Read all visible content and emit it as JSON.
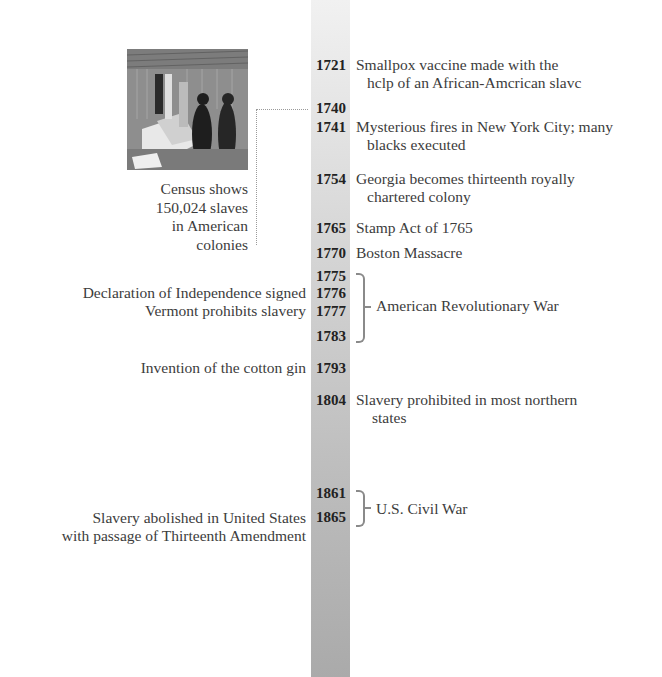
{
  "timeline": {
    "bar_colors": {
      "top": "#f1f1f1",
      "bottom": "#aaaaaa"
    },
    "years": [
      {
        "year": "1721",
        "y": 57
      },
      {
        "year": "1740",
        "y": 100
      },
      {
        "year": "1741",
        "y": 119
      },
      {
        "year": "1754",
        "y": 171
      },
      {
        "year": "1765",
        "y": 220
      },
      {
        "year": "1770",
        "y": 245
      },
      {
        "year": "1775",
        "y": 268
      },
      {
        "year": "1776",
        "y": 285
      },
      {
        "year": "1777",
        "y": 303
      },
      {
        "year": "1783",
        "y": 328
      },
      {
        "year": "1793",
        "y": 360
      },
      {
        "year": "1804",
        "y": 392
      },
      {
        "year": "1861",
        "y": 485
      },
      {
        "year": "1865",
        "y": 509
      }
    ],
    "right_events": [
      {
        "year": "1721",
        "line1": "Smallpox vaccine made with the",
        "line2": "hclp of an African-Amcrican slavc"
      },
      {
        "year": "1741",
        "line1": "Mysterious fires in New York City; many",
        "line2": "blacks executed"
      },
      {
        "year": "1754",
        "line1": "Georgia becomes thirteenth royally",
        "line2": "chartered colony"
      },
      {
        "year": "1765",
        "line1": "Stamp Act of 1765"
      },
      {
        "year": "1770",
        "line1": "Boston Massacre"
      },
      {
        "year": "1804",
        "line1": "Slavery prohibited in most northern",
        "line2": "states"
      }
    ],
    "left_events": [
      {
        "year": "1776",
        "text": "Declaration of Independence signed"
      },
      {
        "year": "1777",
        "text": "Vermont prohibits slavery"
      },
      {
        "year": "1793",
        "text": "Invention of the cotton gin"
      },
      {
        "year": "1865",
        "line1": "Slavery abolished in United States",
        "line2": "with passage of Thirteenth Amendment"
      }
    ],
    "eras": [
      {
        "label": "American Revolutionary War",
        "from": "1775",
        "to": "1783"
      },
      {
        "label": "U.S. Civil War",
        "from": "1861",
        "to": "1865"
      }
    ],
    "photo": {
      "alt": "Engraving of a slave auction",
      "year": "1740",
      "caption": [
        "Census shows",
        "150,024 slaves",
        "in American",
        "colonies"
      ]
    }
  }
}
